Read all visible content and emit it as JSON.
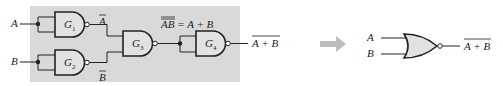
{
  "diagram": {
    "left_circuit": {
      "background_color": "#d9d9d9",
      "inputs": [
        "A",
        "B"
      ],
      "gates": [
        {
          "id": "G1",
          "letter": "G",
          "sub": "1",
          "type": "NAND",
          "output_label": "A"
        },
        {
          "id": "G2",
          "letter": "G",
          "sub": "2",
          "type": "NAND",
          "output_label": "B"
        },
        {
          "id": "G3",
          "letter": "G",
          "sub": "3",
          "type": "NAND"
        },
        {
          "id": "G4",
          "letter": "G",
          "sub": "4",
          "type": "NAND"
        }
      ],
      "g3_output_label": "AB = A + B",
      "g3_output_label_overbar": "AB",
      "g3_output_label_rest": " = A + B",
      "final_output": "A + B"
    },
    "arrow": {
      "color": "#bdbdbd",
      "meaning": "equivalent-to"
    },
    "right_circuit": {
      "gate_type": "NOR",
      "inputs": [
        "A",
        "B"
      ],
      "output": "A + B"
    }
  }
}
